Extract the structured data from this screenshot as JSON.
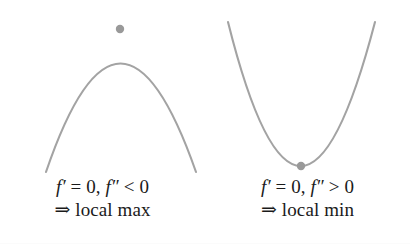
{
  "figure": {
    "background_color": "#ffffff",
    "curve_color": "#a3a3a3",
    "point_color": "#999999",
    "text_color": "#1a1a1a",
    "stroke_width": 2.1,
    "point_radius": 4.2
  },
  "panels": [
    {
      "id": "local-max",
      "curve_shape": "downward-parabola",
      "caption_line_1": {
        "function_symbol": "f",
        "prime_first": "′",
        "equals": " = ",
        "value_first": "0,",
        "function_symbol_2": "f",
        "prime_second": "″",
        "relation": " < ",
        "value_second": "0"
      },
      "caption_line_2": {
        "arrow": "⇒",
        "text": " local max"
      },
      "critical_point": {
        "x": 120,
        "y": 29,
        "type": "maximum"
      },
      "endpoints": [
        {
          "x": 46,
          "y": 172
        },
        {
          "x": 196,
          "y": 172
        }
      ]
    },
    {
      "id": "local-min",
      "curve_shape": "upward-parabola",
      "caption_line_1": {
        "function_symbol": "f",
        "prime_first": "′",
        "equals": " = ",
        "value_first": "0,",
        "function_symbol_2": "f",
        "prime_second": "″",
        "relation": " > ",
        "value_second": "0"
      },
      "caption_line_2": {
        "arrow": "⇒",
        "text": " local min"
      },
      "critical_point": {
        "x": 300,
        "y": 166,
        "type": "minimum"
      },
      "endpoints": [
        {
          "x": 228,
          "y": 22
        },
        {
          "x": 375,
          "y": 22
        }
      ]
    }
  ],
  "chart_data": {
    "type": "line",
    "xlabel": "",
    "ylabel": "",
    "grid": false,
    "legend": "none",
    "series": [
      {
        "name": "local max curve",
        "shape": "concave-down parabola",
        "vertex": [
          120,
          29
        ],
        "points": [
          [
            46,
            172
          ],
          [
            60,
            130
          ],
          [
            75,
            93
          ],
          [
            90,
            64
          ],
          [
            105,
            41
          ],
          [
            120,
            29
          ],
          [
            135,
            36
          ],
          [
            150,
            58
          ],
          [
            165,
            92
          ],
          [
            180,
            130
          ],
          [
            196,
            172
          ]
        ],
        "marker_point": [
          120,
          29
        ]
      },
      {
        "name": "local min curve",
        "shape": "concave-up parabola",
        "vertex": [
          300,
          166
        ],
        "points": [
          [
            228,
            22
          ],
          [
            243,
            58
          ],
          [
            258,
            91
          ],
          [
            272,
            120
          ],
          [
            286,
            148
          ],
          [
            300,
            166
          ],
          [
            314,
            152
          ],
          [
            329,
            122
          ],
          [
            344,
            90
          ],
          [
            360,
            55
          ],
          [
            375,
            22
          ]
        ],
        "marker_point": [
          300,
          166
        ]
      }
    ]
  }
}
